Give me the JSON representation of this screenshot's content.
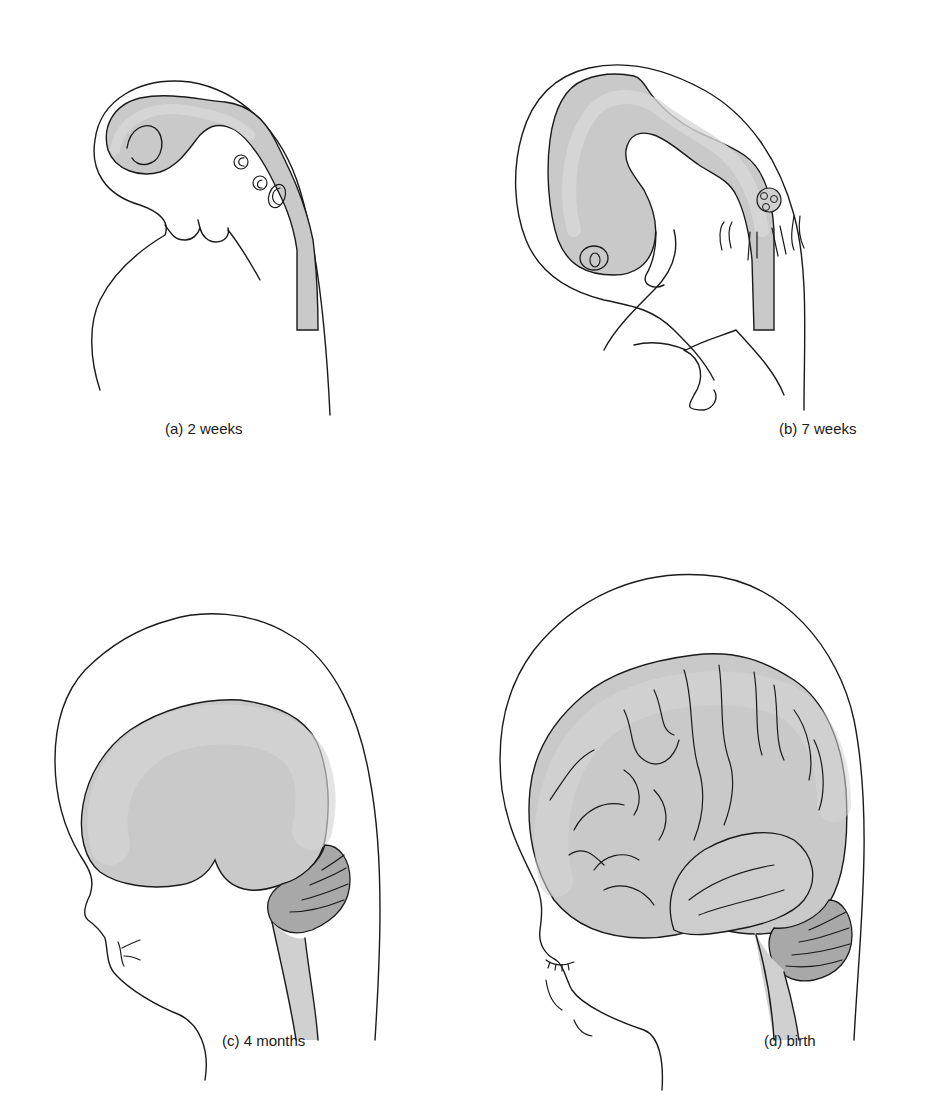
{
  "figure": {
    "panels": [
      {
        "id": "a",
        "caption": "(a) 2 weeks"
      },
      {
        "id": "b",
        "caption": "(b) 7 weeks"
      },
      {
        "id": "c",
        "caption": "(c) 4 months"
      },
      {
        "id": "d",
        "caption": "(d) birth"
      }
    ],
    "colors": {
      "brain_fill": "#c9c9c9",
      "brain_inner": "#d8d8d8",
      "cerebellum_fill": "#a8a8a8",
      "outline": "#1a1a1a",
      "background": "#ffffff"
    }
  }
}
